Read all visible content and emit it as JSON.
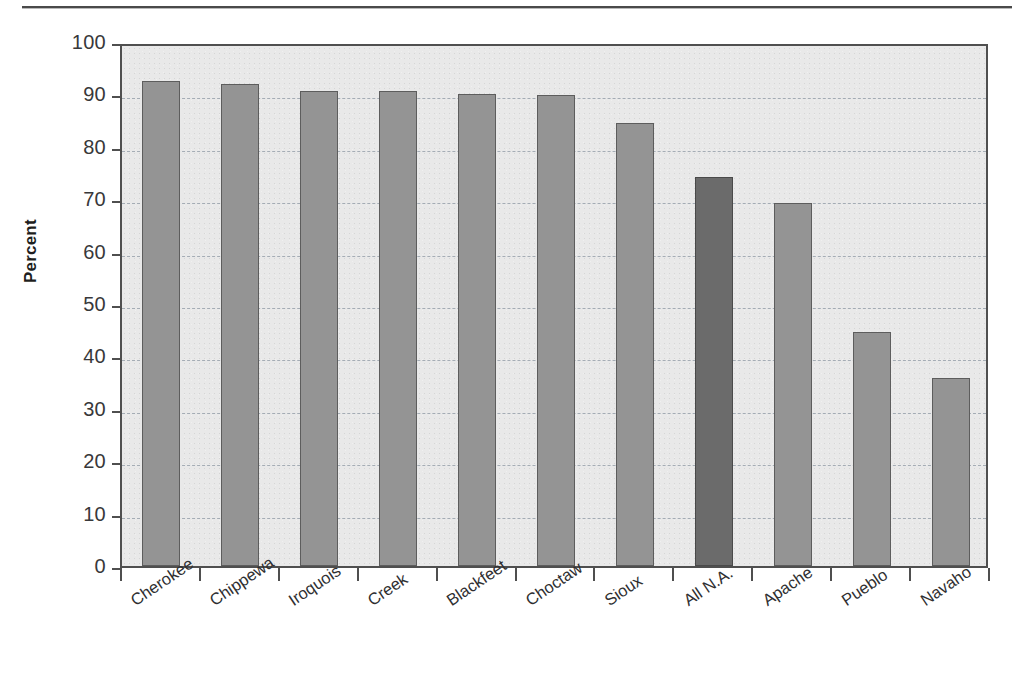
{
  "chart_data": {
    "type": "bar",
    "title": "",
    "subtitle": "",
    "xlabel": "",
    "ylabel": "Percent",
    "ylim": [
      0,
      100
    ],
    "yticks": [
      0,
      10,
      20,
      30,
      40,
      50,
      60,
      70,
      80,
      90,
      100
    ],
    "ytick_labels": [
      "0",
      "10",
      "20",
      "30",
      "40",
      "50",
      "60",
      "70",
      "80",
      "90",
      "100"
    ],
    "grid": "horizontal-dashed",
    "legend": "none",
    "categories": [
      "Cherokee",
      "Chippewa",
      "Iroquois",
      "Creek",
      "Blackfeet",
      "Choctaw",
      "Sioux",
      "All N.A.",
      "Apache",
      "Pueblo",
      "Navaho"
    ],
    "values": [
      92.5,
      92.0,
      90.7,
      90.7,
      90.0,
      89.9,
      84.5,
      74.2,
      69.2,
      44.7,
      35.9
    ],
    "highlight_category": "All N.A.",
    "highlight_index": 7,
    "bar_color": "#949494",
    "highlight_color": "#6b6b6b",
    "bar_edge_color": "#5d5d5d",
    "plot_background": "#e9e9e9",
    "axis_color": "#4f4f4f",
    "gridline_color": "#9aa3ad"
  }
}
